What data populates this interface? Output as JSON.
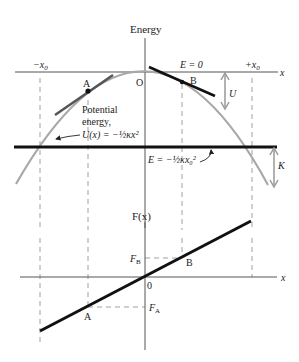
{
  "top_plot": {
    "y_axis_label": "Energy",
    "x_axis_label": "x",
    "origin_label": "O",
    "neg_x0_label": "−x",
    "neg_x0_sub": "0",
    "pos_x0_label": "+x",
    "pos_x0_sub": "0",
    "e_zero_label": "E = 0",
    "point_a_label": "A",
    "point_b_label": "B",
    "u_label": "U",
    "k_label": "K",
    "potential_label_line1": "Potential",
    "potential_label_line2": "energy,",
    "potential_formula": "U(x) = −½κx²",
    "energy_line_formula": "E = −½κx₀²"
  },
  "bottom_plot": {
    "y_axis_label": "F(x)",
    "x_axis_label": "x",
    "origin_label": "0",
    "fb_label": "F",
    "fb_sub": "B",
    "fa_label": "F",
    "fa_sub": "A",
    "point_a_label": "A",
    "point_b_label": "B"
  },
  "colors": {
    "axis": "#555555",
    "curve": "#a8a8a8",
    "thick_line": "#111111",
    "tangent_a": "#555555",
    "dashed": "#888888",
    "arrow": "#999999"
  }
}
